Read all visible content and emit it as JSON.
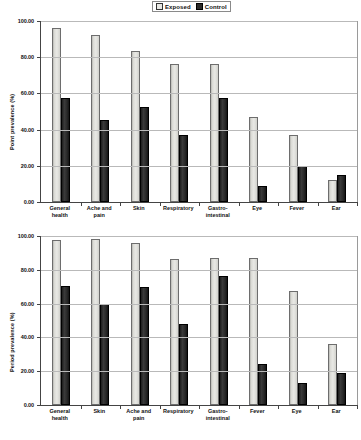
{
  "legend": {
    "items": [
      {
        "label": "Exposed",
        "swatch": "light-square-icon",
        "color": "#e8e8e4"
      },
      {
        "label": "Control",
        "swatch": "dark-square-icon",
        "color": "#2b2b2b"
      }
    ]
  },
  "chart_data": [
    {
      "type": "bar",
      "id": "point-prevalence",
      "title": "",
      "xlabel": "",
      "ylabel": "Point prevalence (%)",
      "ylim": [
        0,
        100
      ],
      "yticks": [
        0,
        20,
        40,
        60,
        80,
        100
      ],
      "ytick_labels": [
        "0.00",
        "20.00",
        "40.00",
        "60.00",
        "80.00",
        "100.00"
      ],
      "grid": true,
      "legend_position": "top-center",
      "categories": [
        "General\nhealth",
        "Ache and\npain",
        "Skin",
        "Respiratory",
        "Gastro-\nintestinal",
        "Eye",
        "Fever",
        "Ear"
      ],
      "series": [
        {
          "name": "Exposed",
          "color": "#e8e8e4",
          "values": [
            96.0,
            92.0,
            83.5,
            76.0,
            76.0,
            47.0,
            37.0,
            12.0
          ]
        },
        {
          "name": "Control",
          "color": "#2b2b2b",
          "values": [
            57.5,
            45.5,
            52.5,
            37.0,
            57.5,
            9.0,
            20.0,
            15.0
          ]
        }
      ]
    },
    {
      "type": "bar",
      "id": "period-prevalence",
      "title": "",
      "xlabel": "",
      "ylabel": "Period prevalence (%)",
      "ylim": [
        0,
        100
      ],
      "yticks": [
        0,
        20,
        40,
        60,
        80,
        100
      ],
      "ytick_labels": [
        "0.00",
        "20.00",
        "40.00",
        "60.00",
        "80.00",
        "100.00"
      ],
      "grid": true,
      "legend_position": "none",
      "categories": [
        "General\nhealth",
        "Skin",
        "Ache and\npain",
        "Respiratory",
        "Gastro-\nintestinal",
        "Fever",
        "Eye",
        "Ear"
      ],
      "series": [
        {
          "name": "Exposed",
          "color": "#e8e8e4",
          "values": [
            97.5,
            98.0,
            96.0,
            86.5,
            87.0,
            87.0,
            67.5,
            36.0
          ]
        },
        {
          "name": "Control",
          "color": "#2b2b2b",
          "values": [
            70.5,
            59.5,
            70.0,
            48.0,
            76.5,
            24.5,
            13.0,
            19.0
          ]
        }
      ]
    }
  ]
}
